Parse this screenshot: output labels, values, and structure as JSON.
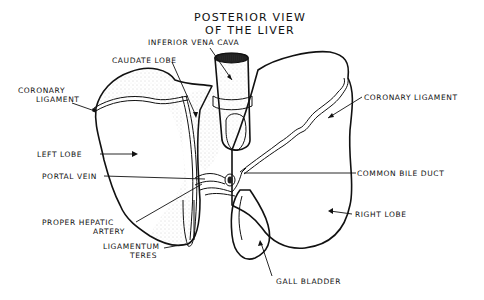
{
  "diagram": {
    "title_line1": "POSTERIOR VIEW",
    "title_line2": "OF THE LIVER",
    "style": "black ink stippled line drawing on white",
    "colors": {
      "ink": "#111111",
      "background": "#ffffff",
      "stipple": "#555555"
    }
  },
  "labels": {
    "inferior_vena_cava": "INFERIOR VENA CAVA",
    "caudate_lobe": "CAUDATE LOBE",
    "coronary_ligament_left_1": "CORONARY",
    "coronary_ligament_left_2": "LIGAMENT",
    "coronary_ligament_right": "CORONARY LIGAMENT",
    "left_lobe": "LEFT LOBE",
    "portal_vein": "PORTAL VEIN",
    "common_bile_duct": "COMMON BILE DUCT",
    "proper_hepatic_artery_1": "PROPER HEPATIC",
    "proper_hepatic_artery_2": "ARTERY",
    "right_lobe": "RIGHT LOBE",
    "ligamentum_teres_1": "LIGAMENTUM",
    "ligamentum_teres_2": "TERES",
    "gall_bladder": "GALL BLADDER"
  }
}
